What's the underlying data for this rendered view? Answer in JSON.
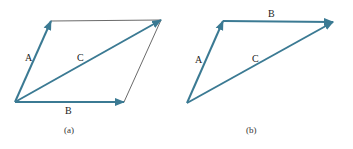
{
  "figure": {
    "vector_color": "#3b7a93",
    "outline_color": "#444444",
    "panels": [
      {
        "caption": "(a)",
        "vectors": [
          {
            "label": "A",
            "from": [
              15,
              102
            ],
            "to": [
              51,
              21
            ]
          },
          {
            "label": "B",
            "from": [
              15,
              102
            ],
            "to": [
              124,
              102
            ]
          },
          {
            "label": "C",
            "from": [
              15,
              102
            ],
            "to": [
              161,
              20
            ]
          }
        ],
        "completion_lines": [
          {
            "from": [
              51,
              21
            ],
            "to": [
              161,
              20
            ]
          },
          {
            "from": [
              161,
              20
            ],
            "to": [
              124,
              102
            ]
          }
        ]
      },
      {
        "caption": "(b)",
        "vectors": [
          {
            "label": "A",
            "from": [
              187,
              103
            ],
            "to": [
              223,
              21
            ]
          },
          {
            "label": "B",
            "from": [
              223,
              21
            ],
            "to": [
              333,
              22
            ]
          },
          {
            "label": "C",
            "from": [
              187,
              103
            ],
            "to": [
              333,
              22
            ]
          }
        ]
      }
    ]
  }
}
